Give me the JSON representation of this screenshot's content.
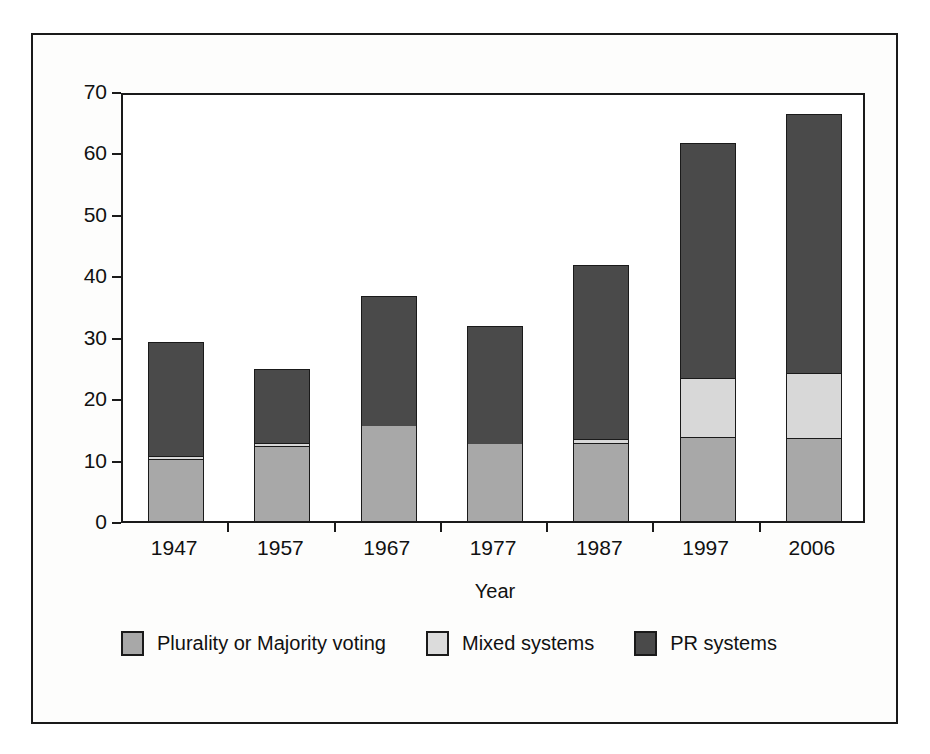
{
  "figure": {
    "x_axis_title": "Year"
  },
  "chart_data": {
    "type": "bar",
    "subtype": "stacked-vertical",
    "title": "",
    "xlabel": "Year",
    "ylabel": "",
    "ylim": [
      0,
      70
    ],
    "yticks": [
      0,
      10,
      20,
      30,
      40,
      50,
      60,
      70
    ],
    "ytick_labels": [
      "0",
      "10",
      "20",
      "30",
      "40",
      "50",
      "60",
      "70"
    ],
    "grid": false,
    "legend_position": "bottom",
    "categories": [
      "1947",
      "1957",
      "1967",
      "1977",
      "1987",
      "1997",
      "2006"
    ],
    "series": [
      {
        "name": "Plurality or Majority voting",
        "color": "#a8a8a8",
        "values": [
          10.0,
          12.0,
          15.4,
          12.5,
          12.6,
          13.5,
          13.4
        ]
      },
      {
        "name": "Mixed systems",
        "color": "#dcdcdc",
        "values": [
          0.6,
          0.7,
          0.0,
          0.0,
          0.7,
          9.8,
          10.7
        ]
      },
      {
        "name": "PR systems",
        "color": "#4a4a4a",
        "values": [
          18.5,
          12.1,
          21.3,
          19.2,
          28.3,
          38.2,
          42.1
        ]
      }
    ],
    "totals": [
      29.1,
      24.8,
      36.7,
      31.7,
      41.6,
      61.5,
      66.2
    ]
  },
  "legend": {
    "items": [
      {
        "label": "Plurality or Majority voting",
        "swatch": "sw-plurality"
      },
      {
        "label": "Mixed systems",
        "swatch": "sw-mixed"
      },
      {
        "label": "PR systems",
        "swatch": "sw-pr"
      }
    ]
  }
}
